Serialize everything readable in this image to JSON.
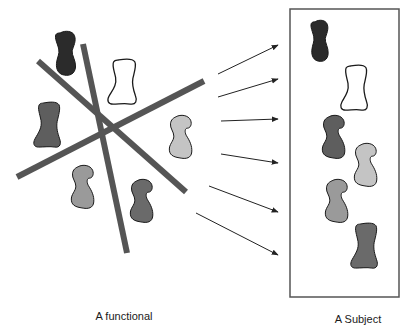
{
  "diagram": {
    "labels": {
      "left": "A functional",
      "right": "A Subject"
    },
    "colors": {
      "bar": "#555555",
      "arrow": "#222222",
      "box_stroke": "#555555",
      "outline": "#1a1a1a",
      "shape_black": "#2b2b2b",
      "shape_dark": "#5e5e5e",
      "shape_darkgray": "#6a6a6a",
      "shape_medium": "#9a9a9a",
      "shape_light": "#c4c4c4",
      "shape_white": "#ffffff"
    },
    "left_group": {
      "bars": [
        {
          "name": "bar-diagonal-down",
          "x1": 38,
          "y1": 61,
          "x2": 186,
          "y2": 192
        },
        {
          "name": "bar-steep",
          "x1": 83,
          "y1": 44,
          "x2": 127,
          "y2": 253
        },
        {
          "name": "bar-diagonal-up",
          "x1": 17,
          "y1": 177,
          "x2": 204,
          "y2": 81
        }
      ],
      "shapes": [
        {
          "name": "blob-black",
          "fill": "shape_black",
          "x": 52,
          "y": 31,
          "w": 28,
          "h": 45,
          "kind": "peanut"
        },
        {
          "name": "blob-white",
          "fill": "shape_white",
          "x": 106,
          "y": 59,
          "w": 32,
          "h": 46,
          "kind": "boot"
        },
        {
          "name": "blob-dark",
          "fill": "shape_dark",
          "x": 32,
          "y": 102,
          "w": 30,
          "h": 46,
          "kind": "boot"
        },
        {
          "name": "blob-light",
          "fill": "shape_light",
          "x": 166,
          "y": 115,
          "w": 28,
          "h": 44,
          "kind": "hook"
        },
        {
          "name": "blob-medium",
          "fill": "shape_medium",
          "x": 68,
          "y": 165,
          "w": 28,
          "h": 44,
          "kind": "hook"
        },
        {
          "name": "blob-darkgray",
          "fill": "shape_darkgray",
          "x": 127,
          "y": 179,
          "w": 28,
          "h": 44,
          "kind": "hook"
        }
      ]
    },
    "arrows": [
      {
        "x1": 218,
        "y1": 74,
        "x2": 278,
        "y2": 45
      },
      {
        "x1": 218,
        "y1": 97,
        "x2": 278,
        "y2": 79
      },
      {
        "x1": 221,
        "y1": 121,
        "x2": 278,
        "y2": 119
      },
      {
        "x1": 221,
        "y1": 154,
        "x2": 278,
        "y2": 163
      },
      {
        "x1": 209,
        "y1": 186,
        "x2": 278,
        "y2": 212
      },
      {
        "x1": 196,
        "y1": 213,
        "x2": 278,
        "y2": 255
      }
    ],
    "subject_box": {
      "x": 290,
      "y": 9,
      "w": 109,
      "h": 288,
      "shapes": [
        {
          "name": "blob-black",
          "fill": "shape_black",
          "x": 308,
          "y": 20,
          "w": 24,
          "h": 42,
          "kind": "peanut"
        },
        {
          "name": "blob-white",
          "fill": "shape_white",
          "x": 339,
          "y": 65,
          "w": 30,
          "h": 46,
          "kind": "boot"
        },
        {
          "name": "blob-dark",
          "fill": "shape_dark",
          "x": 319,
          "y": 115,
          "w": 28,
          "h": 44,
          "kind": "hook"
        },
        {
          "name": "blob-light",
          "fill": "shape_light",
          "x": 351,
          "y": 143,
          "w": 28,
          "h": 44,
          "kind": "hook"
        },
        {
          "name": "blob-medium",
          "fill": "shape_medium",
          "x": 322,
          "y": 179,
          "w": 28,
          "h": 44,
          "kind": "hook"
        },
        {
          "name": "blob-darkgray",
          "fill": "shape_darkgray",
          "x": 349,
          "y": 223,
          "w": 30,
          "h": 46,
          "kind": "boot"
        }
      ]
    }
  }
}
